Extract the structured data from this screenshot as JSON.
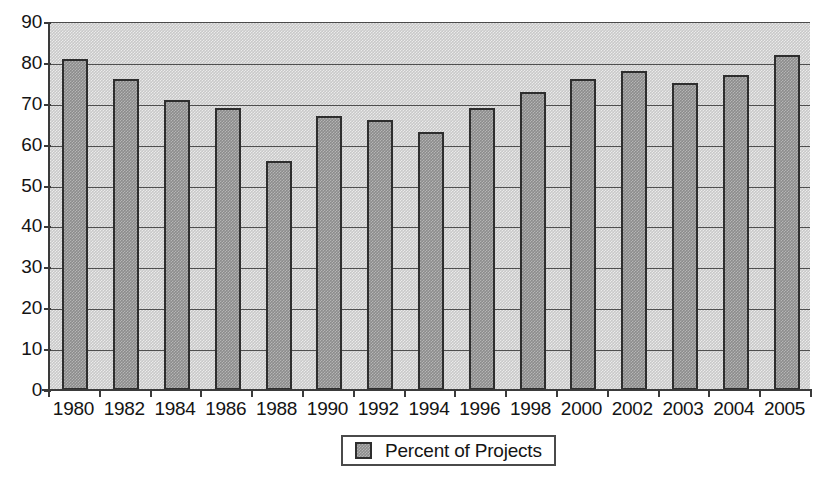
{
  "chart_data": {
    "type": "bar",
    "title": "",
    "subtitle": "",
    "xlabel": "",
    "ylabel": "",
    "ylim": [
      0,
      90
    ],
    "ytick_step": 10,
    "yticks": [
      0,
      10,
      20,
      30,
      40,
      50,
      60,
      70,
      80,
      90
    ],
    "grid": true,
    "grid_axis": "y",
    "legend_position": "bottom-center",
    "categories": [
      "1980",
      "1982",
      "1984",
      "1986",
      "1988",
      "1990",
      "1992",
      "1994",
      "1996",
      "1998",
      "2000",
      "2002",
      "2003",
      "2004",
      "2005"
    ],
    "series": [
      {
        "name": "Percent of Projects",
        "values": [
          81,
          76,
          71,
          69,
          56,
          67,
          66,
          63,
          69,
          73,
          76,
          78,
          75,
          77,
          82
        ],
        "color": "#8c8c8c",
        "border_color": "#2e2e2e"
      }
    ]
  },
  "legend": {
    "entries": [
      {
        "label": "Percent of Projects",
        "swatch_name": "legend-swatch-percent-of-projects"
      }
    ]
  },
  "colors": {
    "plot_background": "#c9c9c9",
    "bar_fill": "#8c8c8c",
    "bar_border": "#2e2e2e",
    "gridline": "#4f4f4f",
    "axis": "#3a3a3a",
    "text": "#141414",
    "page_background": "#ffffff"
  }
}
